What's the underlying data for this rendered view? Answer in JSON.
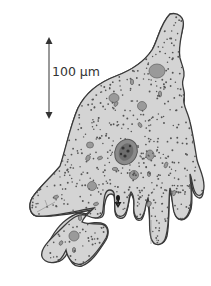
{
  "figure": {
    "scale_bar": {
      "label": "100 µm",
      "orientation": "vertical",
      "arrow": "double-headed"
    },
    "colors": {
      "cytoplasm": "#d4d4d4",
      "outline": "#3a3a3a",
      "granules": "#555555",
      "vacuoles": "#9a9a9a",
      "nucleus": "#8a8a8a",
      "text": "#333333"
    },
    "structures": [
      "cell membrane",
      "cytoplasm granules",
      "food vacuoles",
      "nucleus",
      "pseudopodia",
      "engulfed particle"
    ]
  }
}
